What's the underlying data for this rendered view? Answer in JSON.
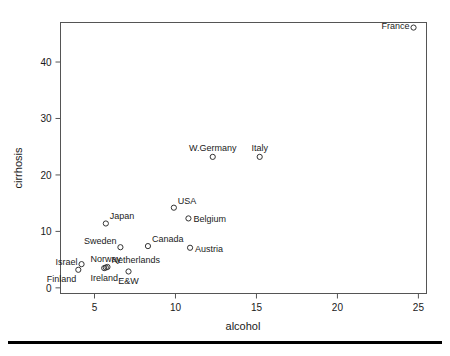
{
  "chart_data": {
    "type": "scatter",
    "title": "",
    "xlabel": "alcohol",
    "ylabel": "cirrhosis",
    "xlim": [
      2.9,
      25.5
    ],
    "ylim": [
      -1.0,
      47.0
    ],
    "grid": false,
    "legend": "none",
    "xticks": [
      5,
      10,
      15,
      20,
      25
    ],
    "yticks": [
      0,
      10,
      20,
      30,
      40
    ],
    "xtick_labels": [
      "5",
      "10",
      "15",
      "20",
      "25"
    ],
    "ytick_labels": [
      "0",
      "10",
      "20",
      "30",
      "40"
    ],
    "points": [
      {
        "label": "France",
        "x": 24.7,
        "y": 46.1,
        "label_pos": "left"
      },
      {
        "label": "Italy",
        "x": 15.2,
        "y": 23.2,
        "label_pos": "above"
      },
      {
        "label": "W.Germany",
        "x": 12.3,
        "y": 23.2,
        "label_pos": "above"
      },
      {
        "label": "USA",
        "x": 9.9,
        "y": 14.2,
        "label_pos": "upper-right"
      },
      {
        "label": "Belgium",
        "x": 10.8,
        "y": 12.3,
        "label_pos": "right"
      },
      {
        "label": "Japan",
        "x": 5.7,
        "y": 11.4,
        "label_pos": "upper-right"
      },
      {
        "label": "Canada",
        "x": 8.3,
        "y": 7.4,
        "label_pos": "upper-right"
      },
      {
        "label": "Austria",
        "x": 10.9,
        "y": 7.1,
        "label_pos": "right"
      },
      {
        "label": "Sweden",
        "x": 6.6,
        "y": 7.2,
        "label_pos": "upper-left"
      },
      {
        "label": "Israel",
        "x": 4.2,
        "y": 4.2,
        "label_pos": "left"
      },
      {
        "label": "Norway",
        "x": 5.7,
        "y": 3.6,
        "label_pos": "above"
      },
      {
        "label": "Netherlands",
        "x": 5.8,
        "y": 3.7,
        "label_pos": "upper-right"
      },
      {
        "label": "Ireland",
        "x": 5.6,
        "y": 3.5,
        "label_pos": "below"
      },
      {
        "label": "E&W",
        "x": 7.1,
        "y": 2.9,
        "label_pos": "below"
      },
      {
        "label": "Finland",
        "x": 4.0,
        "y": 3.2,
        "label_pos": "below-left"
      }
    ]
  }
}
